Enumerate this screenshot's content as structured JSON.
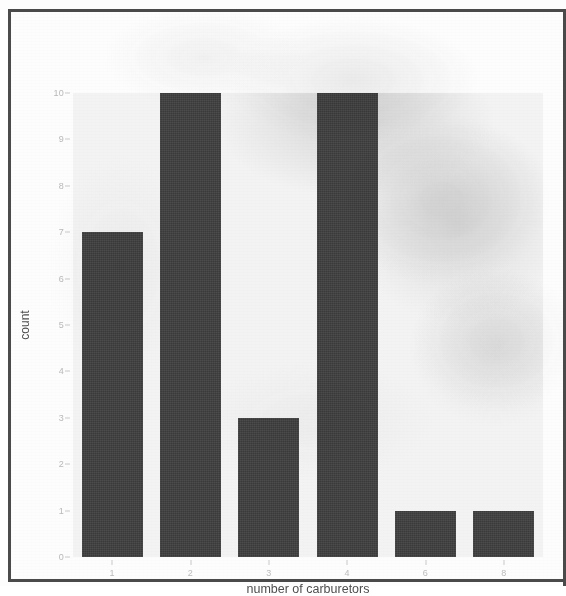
{
  "chart_data": {
    "type": "bar",
    "title": "",
    "subtitle": "",
    "xlabel": "number of carburetors",
    "ylabel": "count",
    "categories": [
      "1",
      "2",
      "3",
      "4",
      "6",
      "8"
    ],
    "values": [
      7,
      10,
      3,
      10,
      1,
      1
    ],
    "series": [
      {
        "name": "count",
        "values": [
          7,
          10,
          3,
          10,
          1,
          1
        ]
      }
    ],
    "x_tick_labels": [
      "1",
      "2",
      "3",
      "4",
      "6",
      "8"
    ],
    "y_tick_labels": [
      "0",
      "1",
      "2",
      "3",
      "4",
      "5",
      "6",
      "7",
      "8",
      "9",
      "10"
    ],
    "y_tick_values": [
      0,
      1,
      2,
      3,
      4,
      5,
      6,
      7,
      8,
      9,
      10
    ],
    "ylim": [
      0,
      10
    ],
    "grid": false,
    "legend": "none",
    "annotations": [],
    "colors": {
      "bar_fill": "#3f3f3f",
      "panel_background": "#f3f3f3",
      "page_background": "#fdfdfd",
      "tick_label": "#bcbcbc",
      "axis_title": "#4e4e4e",
      "frame_border": "#4a4a4a"
    }
  }
}
